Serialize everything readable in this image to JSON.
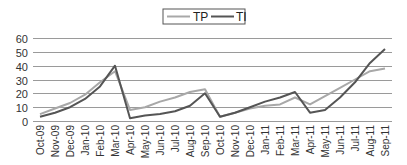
{
  "chart_data": {
    "type": "line",
    "title": "",
    "xlabel": "",
    "ylabel": "",
    "ylim": [
      0,
      60
    ],
    "yticks": [
      0,
      10,
      20,
      30,
      40,
      50,
      60
    ],
    "grid": true,
    "legend_position": "top",
    "categories": [
      "Oct-09",
      "Nov-09",
      "Dec-09",
      "Jan-10",
      "Feb-10",
      "Mar-10",
      "Apr-10",
      "May-10",
      "Jun-10",
      "Jul-10",
      "Aug-10",
      "Sep-10",
      "Oct-10",
      "Nov-10",
      "Dec-10",
      "Jan-11",
      "Feb-11",
      "Mar-11",
      "Apr-11",
      "May-11",
      "Jun-11",
      "Jul-11",
      "Aug-11",
      "Sep-11"
    ],
    "series": [
      {
        "name": "TP",
        "color": "#a8a8a8",
        "values": [
          5,
          9,
          13,
          19,
          28,
          36,
          8,
          10,
          14,
          17,
          21,
          23,
          3,
          6,
          9,
          11,
          12,
          17,
          12,
          18,
          24,
          30,
          36,
          38
        ]
      },
      {
        "name": "TI",
        "color": "#555555",
        "values": [
          3,
          6,
          10,
          16,
          25,
          40,
          2,
          4,
          5,
          7,
          11,
          20,
          3,
          6,
          10,
          14,
          17,
          21,
          6,
          8,
          17,
          28,
          42,
          52
        ]
      }
    ]
  }
}
